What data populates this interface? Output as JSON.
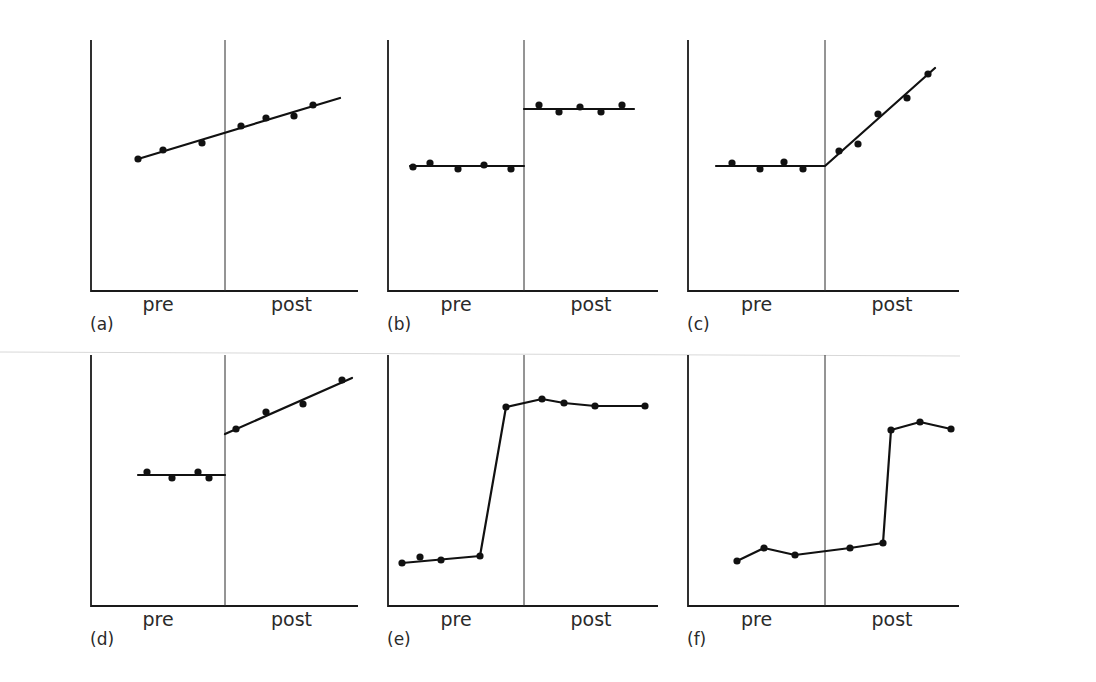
{
  "figure": {
    "panels_count": 6,
    "colors": {
      "ink": "#111111",
      "background": "#ffffff"
    }
  },
  "chart_data": [
    {
      "id": "a",
      "panel_label": "(a)",
      "type": "scatter",
      "title": "",
      "xlabel": "",
      "ylabel": "",
      "categories": [
        "pre",
        "post"
      ],
      "grid": false,
      "description": "Single continuous linear trend across pre and post (no intervention effect)",
      "frame": {
        "x0": 91,
        "x1": 358,
        "y0": 40,
        "y1": 291,
        "divider": 225
      },
      "points": [
        [
          138,
          159
        ],
        [
          163,
          150
        ],
        [
          202,
          143
        ],
        [
          241,
          126
        ],
        [
          266,
          118
        ],
        [
          294,
          116
        ],
        [
          313,
          105
        ]
      ],
      "lines": [
        [
          [
            138,
            159
          ],
          [
            340,
            98
          ]
        ]
      ]
    },
    {
      "id": "b",
      "panel_label": "(b)",
      "type": "scatter",
      "title": "",
      "xlabel": "",
      "ylabel": "",
      "categories": [
        "pre",
        "post"
      ],
      "grid": false,
      "description": "Level change: flat pre, flat higher post",
      "frame": {
        "x0": 388,
        "x1": 658,
        "y0": 40,
        "y1": 291,
        "divider": 524
      },
      "points": [
        [
          413,
          167
        ],
        [
          430,
          163
        ],
        [
          458,
          169
        ],
        [
          484,
          165
        ],
        [
          511,
          169
        ],
        [
          539,
          105
        ],
        [
          559,
          112
        ],
        [
          580,
          107
        ],
        [
          601,
          112
        ],
        [
          622,
          105
        ]
      ],
      "lines": [
        [
          [
            410,
            166
          ],
          [
            524,
            166
          ]
        ],
        [
          [
            524,
            109
          ],
          [
            634,
            109
          ]
        ]
      ]
    },
    {
      "id": "c",
      "panel_label": "(c)",
      "type": "scatter",
      "title": "",
      "xlabel": "",
      "ylabel": "",
      "categories": [
        "pre",
        "post"
      ],
      "grid": false,
      "description": "Slope change: flat pre, rising trend post",
      "frame": {
        "x0": 688,
        "x1": 959,
        "y0": 40,
        "y1": 291,
        "divider": 825
      },
      "points": [
        [
          732,
          163
        ],
        [
          760,
          169
        ],
        [
          784,
          162
        ],
        [
          803,
          169
        ],
        [
          839,
          151
        ],
        [
          858,
          144
        ],
        [
          878,
          114
        ],
        [
          907,
          98
        ],
        [
          928,
          74
        ]
      ],
      "lines": [
        [
          [
            716,
            166
          ],
          [
            825,
            166
          ],
          [
            935,
            68
          ]
        ]
      ]
    },
    {
      "id": "d",
      "panel_label": "(d)",
      "type": "scatter",
      "title": "",
      "xlabel": "",
      "ylabel": "",
      "categories": [
        "pre",
        "post"
      ],
      "grid": false,
      "description": "Level and slope change: flat pre, jump then rising post",
      "frame": {
        "x0": 91,
        "x1": 358,
        "y0": 355,
        "y1": 606,
        "divider": 225
      },
      "points": [
        [
          147,
          472
        ],
        [
          172,
          478
        ],
        [
          198,
          472
        ],
        [
          209,
          478
        ],
        [
          236,
          429
        ],
        [
          266,
          412
        ],
        [
          303,
          404
        ],
        [
          342,
          380
        ]
      ],
      "lines": [
        [
          [
            138,
            475
          ],
          [
            225,
            475
          ]
        ],
        [
          [
            225,
            434
          ],
          [
            352,
            378
          ]
        ]
      ]
    },
    {
      "id": "e",
      "panel_label": "(e)",
      "type": "line",
      "title": "",
      "xlabel": "",
      "ylabel": "",
      "categories": [
        "pre",
        "post"
      ],
      "grid": false,
      "description": "Change occurring before intervention (jump within pre period)",
      "frame": {
        "x0": 388,
        "x1": 658,
        "y0": 355,
        "y1": 606,
        "divider": 524
      },
      "points": [
        [
          402,
          563
        ],
        [
          420,
          557
        ],
        [
          441,
          560
        ],
        [
          480,
          556
        ],
        [
          506,
          407
        ],
        [
          542,
          399
        ],
        [
          564,
          403
        ],
        [
          595,
          406
        ],
        [
          645,
          406
        ]
      ],
      "lines": [
        [
          [
            402,
            563
          ],
          [
            480,
            556
          ],
          [
            506,
            407
          ],
          [
            542,
            399
          ],
          [
            564,
            403
          ],
          [
            595,
            406
          ],
          [
            645,
            406
          ]
        ]
      ]
    },
    {
      "id": "f",
      "panel_label": "(f)",
      "type": "line",
      "title": "",
      "xlabel": "",
      "ylabel": "",
      "categories": [
        "pre",
        "post"
      ],
      "grid": false,
      "description": "Delayed change: jump occurs well after intervention",
      "frame": {
        "x0": 688,
        "x1": 959,
        "y0": 355,
        "y1": 606,
        "divider": 825
      },
      "points": [
        [
          737,
          561
        ],
        [
          764,
          548
        ],
        [
          795,
          555
        ],
        [
          850,
          548
        ],
        [
          883,
          543
        ],
        [
          891,
          430
        ],
        [
          920,
          422
        ],
        [
          951,
          429
        ]
      ],
      "lines": [
        [
          [
            737,
            561
          ],
          [
            764,
            548
          ],
          [
            795,
            555
          ],
          [
            850,
            548
          ],
          [
            883,
            543
          ],
          [
            891,
            430
          ],
          [
            920,
            422
          ],
          [
            951,
            429
          ]
        ]
      ]
    }
  ],
  "labels": {
    "pre": "pre",
    "post": "post"
  }
}
